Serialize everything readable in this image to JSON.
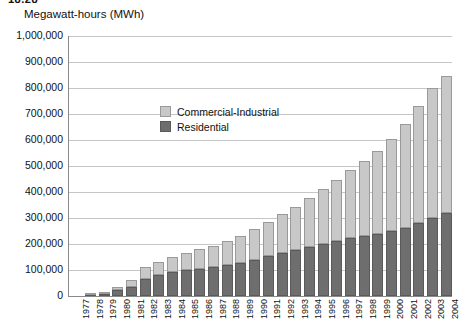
{
  "figure_number": "18.28",
  "axis_title": "Megawatt-hours (MWh)",
  "legend": {
    "position": "inside-upper-left",
    "items": [
      {
        "label": "Commercial-Industrial",
        "color": "#c8c8c8"
      },
      {
        "label": "Residential",
        "color": "#6e6e6e"
      }
    ]
  },
  "chart_data": {
    "type": "bar",
    "stacked": true,
    "title": "Megawatt-hours (MWh)",
    "xlabel": "",
    "ylabel": "Megawatt-hours (MWh)",
    "ylim": [
      0,
      1000000
    ],
    "ytick_step": 100000,
    "grid": true,
    "ytick_labels": [
      "1,000,000",
      "900,000",
      "800,000",
      "700,000",
      "600,000",
      "500,000",
      "400,000",
      "300,000",
      "200,000",
      "100,000",
      "0"
    ],
    "categories": [
      "1977",
      "1978",
      "1979",
      "1980",
      "1981",
      "1982",
      "1983",
      "1984",
      "1985",
      "1986",
      "1987",
      "1988",
      "1989",
      "1990",
      "1991",
      "1992",
      "1993",
      "1994",
      "1995",
      "1996",
      "1997",
      "1998",
      "1999",
      "2000",
      "2001",
      "2002",
      "2003",
      "2004"
    ],
    "series": [
      {
        "name": "Residential",
        "color": "#6e6e6e",
        "values": [
          0,
          2000,
          8000,
          22000,
          34000,
          66000,
          80000,
          92000,
          100000,
          105000,
          110000,
          118000,
          128000,
          140000,
          152000,
          164000,
          176000,
          188000,
          200000,
          212000,
          222000,
          232000,
          240000,
          250000,
          262000,
          282000,
          300000,
          318000
        ]
      },
      {
        "name": "Commercial-Industrial",
        "color": "#c8c8c8",
        "values": [
          0,
          2000,
          6000,
          12000,
          26000,
          44000,
          52000,
          60000,
          66000,
          74000,
          82000,
          92000,
          104000,
          118000,
          132000,
          150000,
          168000,
          190000,
          212000,
          236000,
          262000,
          288000,
          318000,
          354000,
          400000,
          450000,
          500000,
          530000
        ]
      }
    ],
    "totals": [
      0,
      4000,
      14000,
      34000,
      60000,
      110000,
      132000,
      152000,
      166000,
      179000,
      192000,
      210000,
      232000,
      258000,
      284000,
      314000,
      344000,
      378000,
      412000,
      448000,
      484000,
      520000,
      558000,
      604000,
      662000,
      732000,
      800000,
      848000
    ]
  }
}
